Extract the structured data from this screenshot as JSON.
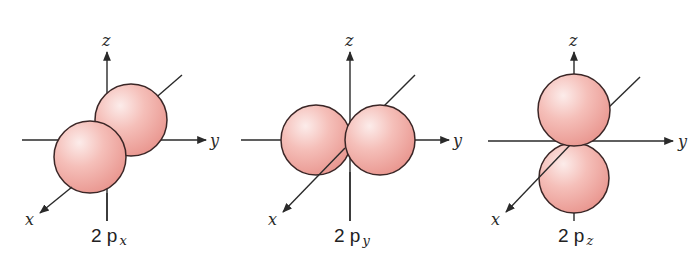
{
  "figure": {
    "colors": {
      "lobe_fill_light": "#fbe3e0",
      "lobe_fill_mid": "#f3b5af",
      "lobe_fill_dark": "#e89891",
      "lobe_outline": "#3a2626",
      "axis": "#2a2a2a"
    },
    "panels": [
      {
        "id": "2px",
        "label_main": "2 p",
        "label_sub": "x",
        "axes": {
          "x": "x",
          "y": "y",
          "z": "z"
        }
      },
      {
        "id": "2py",
        "label_main": "2 p",
        "label_sub": "y",
        "axes": {
          "x": "x",
          "y": "y",
          "z": "z"
        }
      },
      {
        "id": "2pz",
        "label_main": "2 p",
        "label_sub": "z",
        "axes": {
          "x": "x",
          "y": "y",
          "z": "z"
        }
      }
    ]
  }
}
